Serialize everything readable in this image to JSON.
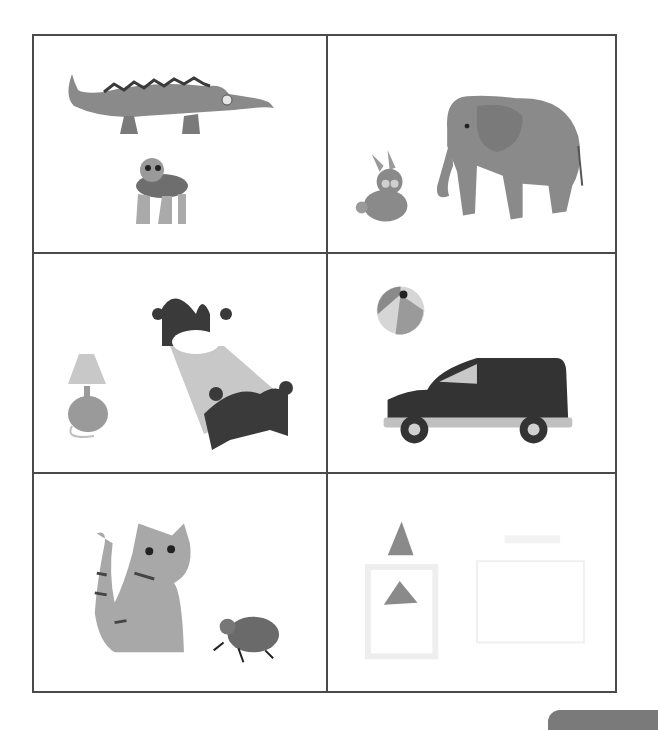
{
  "worksheet": {
    "cells": [
      {
        "row": 1,
        "col": 1,
        "items": [
          "crocodile",
          "turtle"
        ]
      },
      {
        "row": 1,
        "col": 2,
        "items": [
          "rabbit",
          "elephant"
        ]
      },
      {
        "row": 2,
        "col": 1,
        "items": [
          "lamp",
          "bed"
        ]
      },
      {
        "row": 2,
        "col": 2,
        "items": [
          "beach-ball",
          "van"
        ]
      },
      {
        "row": 3,
        "col": 1,
        "items": [
          "cat",
          "beetle"
        ]
      },
      {
        "row": 3,
        "col": 2,
        "items": [
          "glue-bottle",
          "paper-sheet"
        ]
      }
    ]
  },
  "colors": {
    "grid_line": "#4a4a4a",
    "dark_fill": "#3a3a3a",
    "mid_fill": "#8a8a8a",
    "light_fill": "#c8c8c8"
  }
}
